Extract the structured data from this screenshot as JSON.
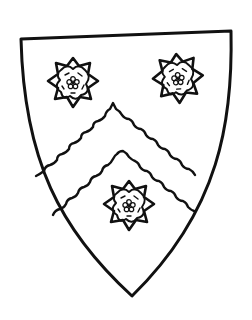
{
  "figure": {
    "charges": [
      {
        "name": "rose",
        "position": "dexter chief"
      },
      {
        "name": "rose",
        "position": "sinister chief"
      },
      {
        "name": "rose",
        "position": "base"
      }
    ],
    "ordinary": "chevron engrailed"
  },
  "colors": {
    "ink": "#111111",
    "field": "#ffffff"
  }
}
